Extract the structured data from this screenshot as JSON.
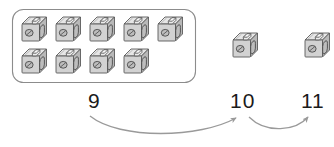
{
  "worksheet": {
    "title": "Counting on with snap cubes",
    "group_box": {
      "name": "ten-frame-group-box",
      "shape": "rounded-rectangle",
      "x": 12,
      "y": 9,
      "width": 184,
      "height": 74,
      "radius": 11,
      "stroke": "#8c8c8c",
      "fill": "#ffffff",
      "cube_count": 9,
      "rows": [
        5,
        4
      ]
    },
    "loose_cubes": [
      {
        "name": "loose-cube-1",
        "x": 232,
        "y": 32
      },
      {
        "name": "loose-cube-2",
        "x": 304,
        "y": 32
      }
    ],
    "cube": {
      "icon_name": "snap-cube-icon",
      "size": 26,
      "face_fill": "#d2d2d2",
      "top_fill": "#e6e6e6",
      "side_fill": "#b8b8b8",
      "stroke": "#5a5a5a",
      "hole_fill": "#bdbdbd",
      "knob_fill": "#ededed"
    },
    "numbers": [
      {
        "name": "number-label-9",
        "text": "9",
        "x": 88,
        "y": 90
      },
      {
        "name": "number-label-10",
        "text": "10",
        "x": 230,
        "y": 90
      },
      {
        "name": "number-label-11",
        "text": "11",
        "x": 301,
        "y": 90
      }
    ],
    "jump_arrows": [
      {
        "name": "jump-arrow-9-to-10",
        "from": 9,
        "to": 10,
        "start_x": 90,
        "start_y": 116,
        "end_x": 237,
        "end_y": 116,
        "sag": 22,
        "stroke": "#9a9a9a"
      },
      {
        "name": "jump-arrow-10-to-11",
        "from": 10,
        "to": 11,
        "start_x": 250,
        "start_y": 116,
        "end_x": 308,
        "end_y": 116,
        "sag": 16,
        "stroke": "#9a9a9a"
      }
    ],
    "colors": {
      "ink": "#1b1b1b",
      "arrow": "#9a9a9a",
      "box_outline": "#8c8c8c",
      "background": "#ffffff"
    }
  }
}
